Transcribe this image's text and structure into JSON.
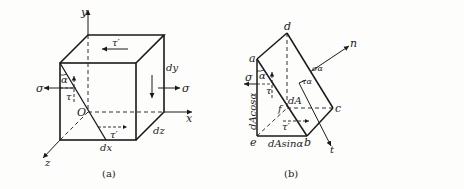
{
  "figure_a": {
    "caption": "(a)",
    "axes": {
      "x": "x",
      "y": "y",
      "z": "z",
      "origin": "O"
    },
    "dimensions": {
      "dx": "dx",
      "dy": "dy",
      "dz": "dz"
    },
    "stresses": {
      "sigma_left": "σ",
      "sigma_right": "σ",
      "tau_front": "τ",
      "tau_left": "τ",
      "tau_prime_top": "τ′",
      "tau_prime_bottom": "τ′",
      "angle": "α"
    }
  },
  "figure_b": {
    "caption": "(b)",
    "vertices": {
      "a": "a",
      "b": "b",
      "c": "c",
      "d": "d",
      "e": "e",
      "f": "f"
    },
    "axes": {
      "n": "n",
      "t": "t"
    },
    "labels": {
      "sigma": "σ",
      "tau": "τ",
      "tau_prime": "τ′",
      "angle": "α",
      "sigma_alpha": "σα",
      "tau_alpha": "τα",
      "area": "dA",
      "vertical_edge": "dAcosα",
      "horizontal_edge": "dAsinα"
    }
  },
  "colors": {
    "line": "#1a1a1a",
    "background": "#fdfdfc"
  }
}
